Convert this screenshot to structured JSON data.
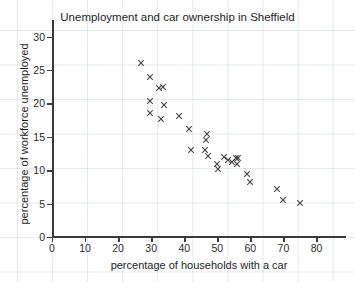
{
  "chart_data": {
    "type": "scatter",
    "title": "Unemployment and car ownership in Sheffield",
    "xlabel": "percentage of households with a car",
    "ylabel": "percentage of workforce unemployed",
    "xlim": [
      0,
      85
    ],
    "ylim": [
      0,
      31
    ],
    "xticks": [
      0,
      10,
      20,
      30,
      40,
      50,
      60,
      70,
      80
    ],
    "yticks": [
      0,
      5,
      10,
      15,
      20,
      25,
      30
    ],
    "grid": true,
    "legend": null,
    "marker": "x",
    "marker_color": "#444444",
    "points": [
      {
        "x": 27,
        "y": 26.1
      },
      {
        "x": 29.5,
        "y": 24.0
      },
      {
        "x": 32.5,
        "y": 22.3
      },
      {
        "x": 33.7,
        "y": 22.5
      },
      {
        "x": 29.5,
        "y": 20.4
      },
      {
        "x": 33.8,
        "y": 19.7
      },
      {
        "x": 29.5,
        "y": 18.6
      },
      {
        "x": 38.5,
        "y": 18.1
      },
      {
        "x": 33.0,
        "y": 17.6
      },
      {
        "x": 41.3,
        "y": 16.1
      },
      {
        "x": 47.0,
        "y": 15.4
      },
      {
        "x": 46.5,
        "y": 14.6
      },
      {
        "x": 42.0,
        "y": 13.1
      },
      {
        "x": 46.3,
        "y": 13.0
      },
      {
        "x": 47.3,
        "y": 12.1
      },
      {
        "x": 52.0,
        "y": 12.0
      },
      {
        "x": 55.6,
        "y": 11.9
      },
      {
        "x": 56.2,
        "y": 11.8
      },
      {
        "x": 53.3,
        "y": 11.5
      },
      {
        "x": 54.3,
        "y": 11.3
      },
      {
        "x": 50.0,
        "y": 11.0
      },
      {
        "x": 56.0,
        "y": 11.0
      },
      {
        "x": 50.2,
        "y": 10.2
      },
      {
        "x": 59.0,
        "y": 9.5
      },
      {
        "x": 60.0,
        "y": 8.2
      },
      {
        "x": 68.0,
        "y": 7.2
      },
      {
        "x": 70.0,
        "y": 5.6
      },
      {
        "x": 75.0,
        "y": 5.1
      }
    ]
  }
}
